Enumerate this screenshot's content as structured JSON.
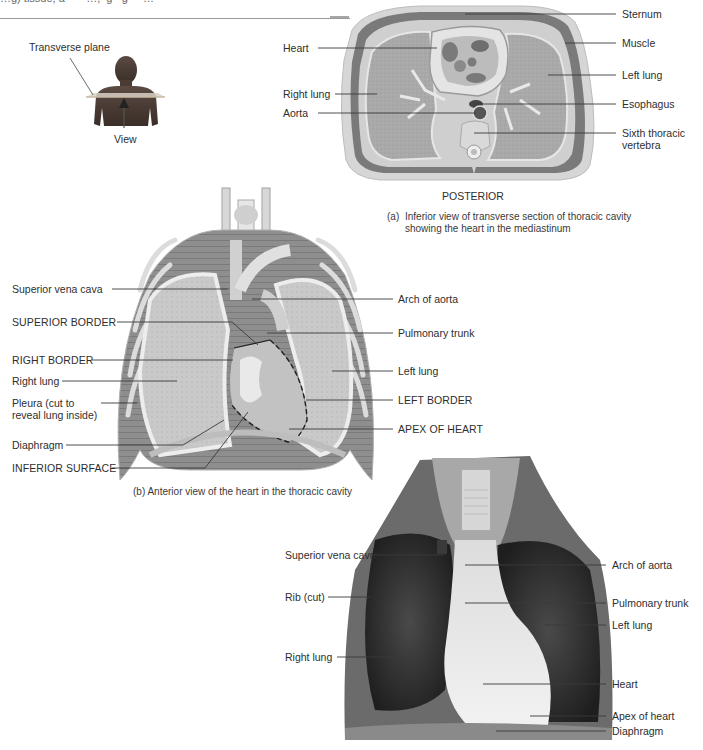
{
  "header": {
    "cut_text": "…g) tissue, a ∙ ∙ ∙ …, ∙g∙ ∙g ∙ ∙ …"
  },
  "figure_a": {
    "inset": {
      "plane_label": "Transverse plane",
      "view_label": "View"
    },
    "left_labels": [
      "Heart",
      "Right lung",
      "Aorta"
    ],
    "right_labels": [
      "Sternum",
      "Muscle",
      "Left lung",
      "Esophagus",
      "Sixth thoracic",
      "vertebra"
    ],
    "orientation": "POSTERIOR",
    "caption_letter": "(a)",
    "caption_line1": "Inferior view of transverse section of thoracic cavity",
    "caption_line2": "showing the heart in the mediastinum"
  },
  "figure_b": {
    "left_labels": [
      "Superior vena cava",
      "SUPERIOR BORDER",
      "RIGHT BORDER",
      "Right lung",
      "Pleura (cut to",
      "reveal lung inside)",
      "Diaphragm",
      "INFERIOR SURFACE"
    ],
    "right_labels": [
      "Arch of aorta",
      "Pulmonary trunk",
      "Left lung",
      "LEFT BORDER",
      "APEX OF HEART"
    ],
    "caption": "(b) Anterior view of the heart in the thoracic cavity"
  },
  "figure_c": {
    "left_labels": [
      "Superior vena cava",
      "Rib (cut)",
      "Right lung"
    ],
    "right_labels": [
      "Arch of aorta",
      "Pulmonary trunk",
      "Left lung",
      "Heart",
      "Apex of heart",
      "Diaphragm"
    ]
  },
  "colors": {
    "leader_line": "#3a3a3a",
    "label_text": "#2e2e2e",
    "illustration_gray": "#b8b8b8",
    "photo_dark": "#2a2a2a"
  }
}
